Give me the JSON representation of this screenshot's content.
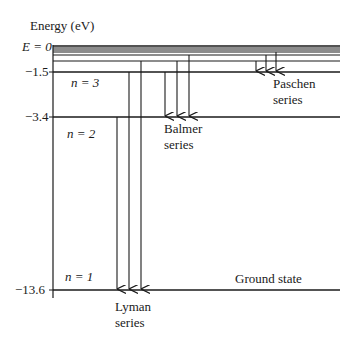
{
  "axis": {
    "title": "Energy (eV)",
    "ticks": [
      {
        "label": "E = 0",
        "value": 0
      },
      {
        "label": "−1.5",
        "value": -1.5
      },
      {
        "label": "−3.4",
        "value": -3.4
      },
      {
        "label": "−13.6",
        "value": -13.6
      }
    ]
  },
  "levels": [
    {
      "n": 1,
      "label": "n = 1",
      "energy_ev": -13.6,
      "note": "Ground state"
    },
    {
      "n": 2,
      "label": "n = 2",
      "energy_ev": -3.4
    },
    {
      "n": 3,
      "label": "n = 3",
      "energy_ev": -1.5
    }
  ],
  "series": [
    {
      "name": "Lyman",
      "label_line1": "Lyman",
      "label_line2": "series",
      "final_level": 1
    },
    {
      "name": "Balmer",
      "label_line1": "Balmer",
      "label_line2": "series",
      "final_level": 2
    },
    {
      "name": "Paschen",
      "label_line1": "Paschen",
      "label_line2": "series",
      "final_level": 3
    }
  ],
  "ground_state_label": "Ground state",
  "colors": {
    "line": "#1a1a1a",
    "background": "#ffffff"
  }
}
